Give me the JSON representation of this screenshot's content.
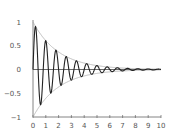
{
  "chart_data": {
    "type": "line",
    "title": "",
    "xlabel": "",
    "ylabel": "",
    "xlim": [
      0,
      10
    ],
    "ylim": [
      -1,
      1
    ],
    "grid": false,
    "legend": null,
    "x_ticks": [
      "0",
      "1",
      "2",
      "3",
      "4",
      "5",
      "6",
      "7",
      "8",
      "9",
      "10"
    ],
    "y_ticks": [
      "1",
      "0.5",
      "0",
      "−0.5",
      "−1"
    ],
    "series": [
      {
        "name": "damped oscillation",
        "formula": "exp(-0.5x)*sin(2.5*pi*x)",
        "color": "#222222",
        "x": [
          0,
          0.2,
          0.6,
          1.0,
          1.4,
          1.8,
          2.2,
          2.6,
          3.0,
          3.4,
          3.8,
          4.2,
          4.6,
          5.0,
          6.0,
          7.0,
          8.0,
          9.0,
          10.0
        ],
        "values": [
          0,
          0.9,
          -0.74,
          0.61,
          -0.5,
          0.41,
          -0.33,
          0.27,
          0.22,
          0.18,
          -0.15,
          0.12,
          -0.1,
          0.08,
          0.05,
          0.03,
          0.02,
          0.01,
          0.0
        ]
      },
      {
        "name": "upper envelope",
        "formula": "exp(-0.5x)",
        "color": "#aaaaaa"
      },
      {
        "name": "lower envelope",
        "formula": "-exp(-0.5x)",
        "color": "#aaaaaa"
      }
    ]
  }
}
